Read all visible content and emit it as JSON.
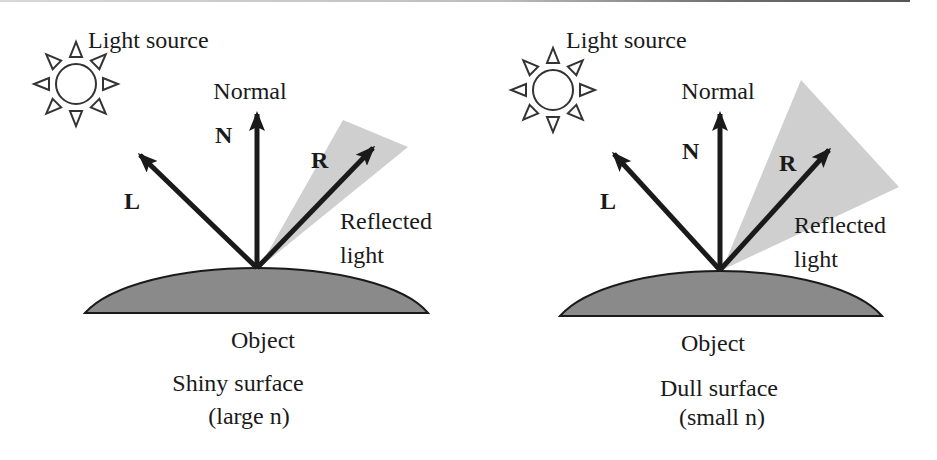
{
  "colors": {
    "ink": "#1a1a1a",
    "object_fill": "#8a8a8a",
    "cone_fill": "#cfcfcf",
    "background": "#ffffff"
  },
  "panels": [
    {
      "id": "shiny",
      "light_source_label": "Light source",
      "normal_label": "Normal",
      "vector_n": "N",
      "vector_l": "L",
      "vector_r": "R",
      "reflected_label_line1": "Reflected",
      "reflected_label_line2": "light",
      "object_label": "Object",
      "surface_label": "Shiny surface",
      "exponent_label": "(large n)",
      "cone": "narrow"
    },
    {
      "id": "dull",
      "light_source_label": "Light source",
      "normal_label": "Normal",
      "vector_n": "N",
      "vector_l": "L",
      "vector_r": "R",
      "reflected_label_line1": "Reflected",
      "reflected_label_line2": "light",
      "object_label": "Object",
      "surface_label": "Dull surface",
      "exponent_label": "(small n)",
      "cone": "wide"
    }
  ],
  "icons": {
    "light_source": "sun-icon"
  }
}
